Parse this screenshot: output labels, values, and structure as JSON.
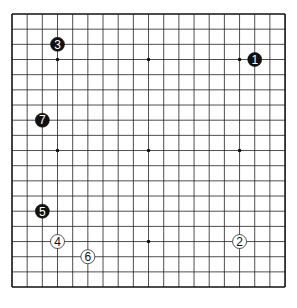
{
  "board": {
    "size": 19,
    "origin_x": 12,
    "origin_y": 14,
    "spacing": 15.17,
    "line_color": "#222222",
    "border_color": "#111111",
    "background": "#ffffff",
    "star_points": [
      [
        4,
        4
      ],
      [
        10,
        4
      ],
      [
        16,
        4
      ],
      [
        4,
        10
      ],
      [
        10,
        10
      ],
      [
        16,
        10
      ],
      [
        4,
        16
      ],
      [
        10,
        16
      ],
      [
        16,
        16
      ]
    ]
  },
  "stones": [
    {
      "move": "1",
      "color": "black",
      "col": 17,
      "row": 4
    },
    {
      "move": "2",
      "color": "white",
      "col": 16,
      "row": 16
    },
    {
      "move": "3",
      "color": "black",
      "col": 4,
      "row": 3
    },
    {
      "move": "4",
      "color": "white",
      "col": 4,
      "row": 16
    },
    {
      "move": "5",
      "color": "black",
      "col": 3,
      "row": 14
    },
    {
      "move": "6",
      "color": "white",
      "col": 6,
      "row": 17
    },
    {
      "move": "7",
      "color": "black",
      "col": 3,
      "row": 8
    }
  ]
}
